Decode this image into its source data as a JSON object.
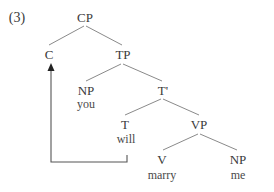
{
  "example_number": "(3)",
  "nodes": {
    "cp": {
      "label": "CP"
    },
    "c": {
      "label": "C"
    },
    "tp": {
      "label": "TP"
    },
    "np_subject": {
      "label": "NP",
      "word": "you"
    },
    "t_bar": {
      "label": "T'"
    },
    "t": {
      "label": "T",
      "word": "will"
    },
    "vp": {
      "label": "VP"
    },
    "v": {
      "label": "V",
      "word": "marry"
    },
    "np_object": {
      "label": "NP",
      "word": "me"
    }
  },
  "edges": [
    {
      "from": "cp",
      "to": "c"
    },
    {
      "from": "cp",
      "to": "tp"
    },
    {
      "from": "tp",
      "to": "np_subject"
    },
    {
      "from": "tp",
      "to": "t_bar"
    },
    {
      "from": "t_bar",
      "to": "t"
    },
    {
      "from": "t_bar",
      "to": "vp"
    },
    {
      "from": "vp",
      "to": "v"
    },
    {
      "from": "vp",
      "to": "np_object"
    }
  ],
  "movement": {
    "from": "t",
    "to": "c",
    "description": "T-to-C movement"
  }
}
